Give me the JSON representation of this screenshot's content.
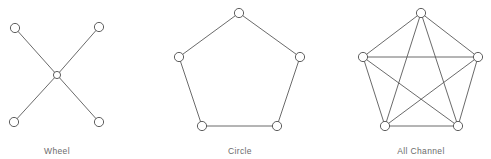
{
  "figure": {
    "background_color": "#ffffff",
    "edge_color": "#595959",
    "node_stroke_color": "#4d4d4d",
    "node_fill_color": "#ffffff",
    "caption_color": "#6b6b6b",
    "width": 491,
    "height": 159
  },
  "chart_data": {
    "type": "diagram",
    "title": "",
    "subtitle": "",
    "xlabel": "",
    "ylabel": "",
    "legend": [],
    "annotations": [],
    "diagram_kind": "network-topology-set",
    "panels": [
      {
        "id": "wheel",
        "label": "Wheel",
        "label_x": 57,
        "label_y": 146,
        "node_count": 5,
        "edge_count": 4,
        "node_radius": 4.6,
        "center_node_radius": 3.6,
        "nodes": [
          {
            "id": "n1",
            "x": 15,
            "y": 28,
            "role": "spoke"
          },
          {
            "id": "n2",
            "x": 99,
            "y": 27,
            "role": "spoke"
          },
          {
            "id": "n3",
            "x": 57,
            "y": 75,
            "role": "hub"
          },
          {
            "id": "n4",
            "x": 14,
            "y": 122,
            "role": "spoke"
          },
          {
            "id": "n5",
            "x": 99,
            "y": 122,
            "role": "spoke"
          }
        ],
        "edges": [
          [
            "n1",
            "n3"
          ],
          [
            "n2",
            "n3"
          ],
          [
            "n4",
            "n3"
          ],
          [
            "n5",
            "n3"
          ]
        ]
      },
      {
        "id": "circle",
        "label": "Circle",
        "label_x": 240,
        "label_y": 146,
        "node_count": 5,
        "edge_count": 5,
        "node_radius": 4.6,
        "nodes": [
          {
            "id": "c1",
            "x": 239,
            "y": 13,
            "role": "ring"
          },
          {
            "id": "c2",
            "x": 300,
            "y": 57,
            "role": "ring"
          },
          {
            "id": "c3",
            "x": 277,
            "y": 126,
            "role": "ring"
          },
          {
            "id": "c4",
            "x": 202,
            "y": 126,
            "role": "ring"
          },
          {
            "id": "c5",
            "x": 179,
            "y": 57,
            "role": "ring"
          }
        ],
        "edges": [
          [
            "c1",
            "c2"
          ],
          [
            "c2",
            "c3"
          ],
          [
            "c3",
            "c4"
          ],
          [
            "c4",
            "c5"
          ],
          [
            "c5",
            "c1"
          ]
        ]
      },
      {
        "id": "all-channel",
        "label": "All Channel",
        "label_x": 421,
        "label_y": 146,
        "node_count": 5,
        "edge_count": 10,
        "node_radius": 4.6,
        "nodes": [
          {
            "id": "a1",
            "x": 421,
            "y": 13,
            "role": "ring"
          },
          {
            "id": "a2",
            "x": 478,
            "y": 57,
            "role": "ring"
          },
          {
            "id": "a3",
            "x": 458,
            "y": 126,
            "role": "ring"
          },
          {
            "id": "a4",
            "x": 385,
            "y": 126,
            "role": "ring"
          },
          {
            "id": "a5",
            "x": 363,
            "y": 57,
            "role": "ring"
          }
        ],
        "edges": [
          [
            "a1",
            "a2"
          ],
          [
            "a2",
            "a3"
          ],
          [
            "a3",
            "a4"
          ],
          [
            "a4",
            "a5"
          ],
          [
            "a5",
            "a1"
          ],
          [
            "a1",
            "a3"
          ],
          [
            "a1",
            "a4"
          ],
          [
            "a2",
            "a4"
          ],
          [
            "a2",
            "a5"
          ],
          [
            "a3",
            "a5"
          ]
        ]
      }
    ]
  }
}
